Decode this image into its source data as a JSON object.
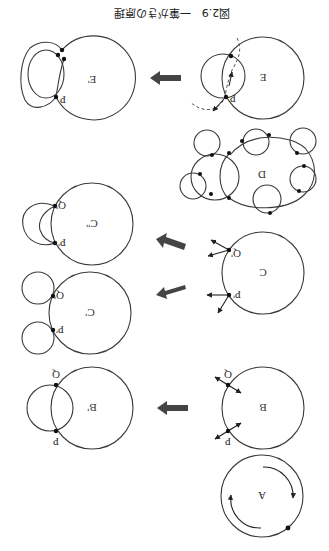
{
  "figure": {
    "orientation": "rotated-180",
    "caption": "図2.9　一筆がきの原理",
    "panels": {
      "A": {
        "label": "A"
      },
      "B": {
        "label": "B",
        "node_p": "P",
        "node_q": "Q"
      },
      "B_prime": {
        "label": "B'",
        "node_p": "P",
        "node_q": "Q"
      },
      "C": {
        "label": "C",
        "node_p": "P'",
        "node_q": "Q'"
      },
      "C_prime": {
        "label": "C'",
        "node_p": "P'",
        "node_q": "Q'"
      },
      "C_dprime": {
        "label": "C''",
        "node_p": "P'",
        "node_q": "Q'"
      },
      "D": {
        "label": "D"
      },
      "E": {
        "label": "E",
        "node_p": "P"
      },
      "E_prime": {
        "label": "E'",
        "node_p": "P"
      }
    },
    "transitions": [
      {
        "from": "B",
        "to": "B'"
      },
      {
        "from": "C",
        "to": "C'"
      },
      {
        "from": "C",
        "to": "C''"
      },
      {
        "from": "E",
        "to": "E'"
      }
    ],
    "colors": {
      "line": "#3a3a3a",
      "arrow": "#444444",
      "node": "#111111",
      "background": "#ffffff"
    }
  }
}
